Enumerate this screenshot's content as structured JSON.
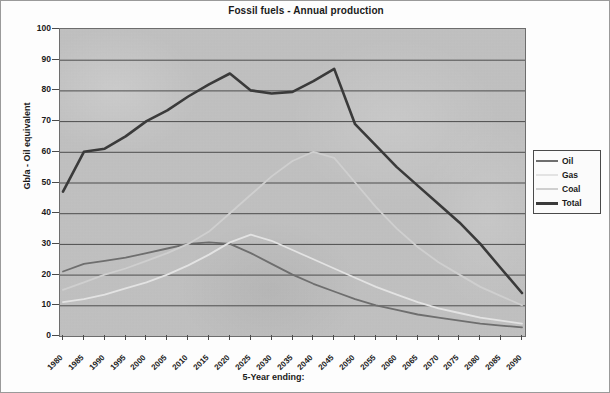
{
  "chart_data": {
    "type": "line",
    "title": "Fossil fuels - Annual production",
    "xlabel": "5-Year ending:",
    "ylabel": "Gb/a - Oil equivalent",
    "ylim": [
      0,
      100
    ],
    "yticks": [
      0,
      10,
      20,
      30,
      40,
      50,
      60,
      70,
      80,
      90,
      100
    ],
    "grid": true,
    "legend_position": "right",
    "x": [
      "1980",
      "1985",
      "1990",
      "1995",
      "2000",
      "2005",
      "2010",
      "2015",
      "2020",
      "2025",
      "2030",
      "2035",
      "2040",
      "2045",
      "2050",
      "2055",
      "2060",
      "2065",
      "2070",
      "2075",
      "2080",
      "2085",
      "2090"
    ],
    "series": [
      {
        "name": "Oil",
        "color": "#6e6e6e",
        "width": 1.8,
        "values": [
          21.0,
          23.5,
          24.5,
          25.5,
          27.0,
          28.5,
          30.0,
          30.5,
          30.0,
          27.0,
          23.5,
          20.0,
          17.0,
          14.5,
          12.0,
          10.0,
          8.5,
          7.0,
          6.0,
          5.0,
          4.0,
          3.4,
          2.8
        ]
      },
      {
        "name": "Gas",
        "color": "#e3e3e3",
        "width": 1.8,
        "values": [
          11.0,
          12.0,
          13.5,
          15.5,
          17.5,
          20.0,
          23.0,
          26.5,
          30.5,
          33.0,
          31.0,
          28.0,
          25.0,
          22.0,
          19.0,
          16.0,
          13.5,
          11.0,
          9.0,
          7.5,
          6.0,
          5.0,
          4.0
        ]
      },
      {
        "name": "Coal",
        "color": "#cfcfcf",
        "width": 1.8,
        "values": [
          15.0,
          17.5,
          20.0,
          22.0,
          24.5,
          27.0,
          30.0,
          34.0,
          40.0,
          46.0,
          52.0,
          57.0,
          60.0,
          58.0,
          50.0,
          42.0,
          35.0,
          29.0,
          24.0,
          20.0,
          16.0,
          13.0,
          10.0
        ]
      },
      {
        "name": "Total",
        "color": "#3a3a3a",
        "width": 2.6,
        "values": [
          47.0,
          60.0,
          61.0,
          65.0,
          70.0,
          73.5,
          78.0,
          82.0,
          85.5,
          80.0,
          79.0,
          79.5,
          83.0,
          87.0,
          69.0,
          62.0,
          55.0,
          49.0,
          43.0,
          37.0,
          30.0,
          22.0,
          14.0
        ]
      }
    ]
  },
  "legend": {
    "items": [
      {
        "label": "Oil"
      },
      {
        "label": "Gas"
      },
      {
        "label": "Coal"
      },
      {
        "label": "Total"
      }
    ]
  }
}
